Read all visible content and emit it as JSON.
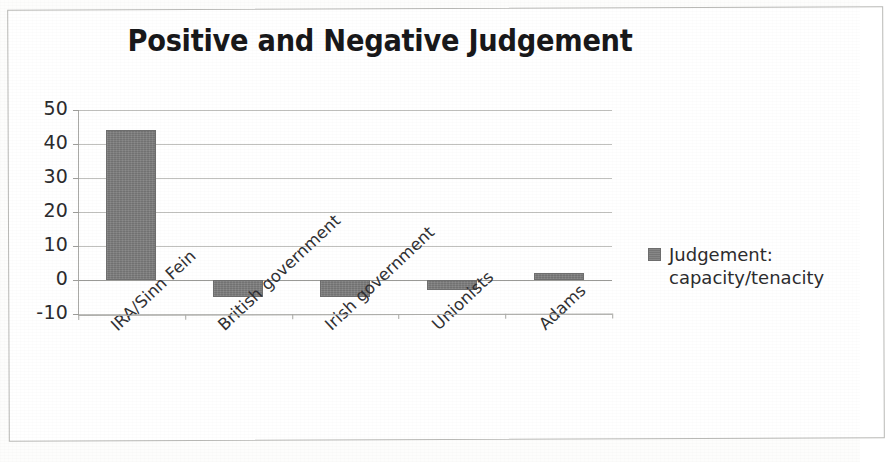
{
  "chart_data": {
    "type": "bar",
    "title": "Positive and Negative Judgement",
    "xlabel": "",
    "ylabel": "",
    "categories": [
      "IRA/Sinn Fein",
      "British government",
      "Irish government",
      "Unionists",
      "Adams"
    ],
    "values": [
      44,
      -5,
      -5,
      -3,
      2
    ],
    "series": [
      {
        "name": "Judgement: capacity/tenacity",
        "values": [
          44,
          -5,
          -5,
          -3,
          2
        ],
        "color": "#7d7d7d"
      }
    ],
    "ylim": [
      -10,
      50
    ],
    "y_ticks": [
      50,
      40,
      30,
      20,
      10,
      0,
      -10
    ],
    "y_tick_labels": [
      "50",
      "40",
      "30",
      "20",
      "10",
      "0",
      "-10"
    ],
    "grid": true,
    "legend_position": "right",
    "legend_entries": [
      {
        "label_line1": "Judgement:",
        "label_line2": "capacity/tenacity",
        "color": "#7d7d7d"
      }
    ]
  },
  "legend": {
    "swatch_icon": "legend-square-icon",
    "line1": "Judgement:",
    "line2": "capacity/tenacity"
  },
  "colors": {
    "bar": "#7d7d7d",
    "bar_border": "#6e6e6e",
    "grid": "#b5b5b2",
    "axis": "#a9a9a6",
    "title_text": "#18181a",
    "tick_text": "#2b2b2d",
    "page_background": "#fdfdfc",
    "frame_border": "#b9b9b6"
  }
}
